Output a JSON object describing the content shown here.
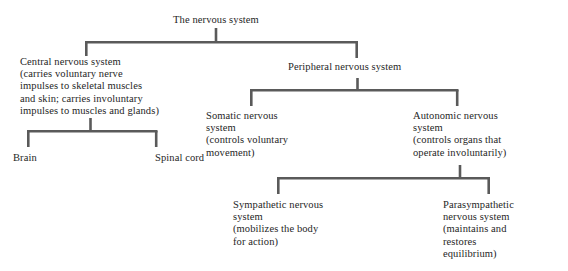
{
  "diagram": {
    "title": "The nervous system",
    "type": "hierarchy-tree",
    "line_color": "#5a5a5a",
    "text_color": "#262626",
    "background": "#ffffff",
    "nodes": [
      {
        "id": "root",
        "label": "The nervous system"
      },
      {
        "id": "cns",
        "label": "Central nervous system\n(carries voluntary nerve\nimpulses to skeletal muscles\nand skin; carries involuntary\nimpulses to muscles and glands)"
      },
      {
        "id": "pns",
        "label": "Peripheral nervous system"
      },
      {
        "id": "brain",
        "label": "Brain"
      },
      {
        "id": "spinal-cord",
        "label": "Spinal cord"
      },
      {
        "id": "somatic",
        "label": "Somatic nervous\nsystem\n(controls voluntary\nmovement)"
      },
      {
        "id": "autonomic",
        "label": "Autonomic nervous\nsystem\n(controls organs that\noperate involuntarily)"
      },
      {
        "id": "sympathetic",
        "label": "Sympathetic nervous\nsystem\n(mobilizes the body\nfor action)"
      },
      {
        "id": "parasympathetic",
        "label": "Parasympathetic\nnervous system\n(maintains and\nrestores\nequilibrium)"
      }
    ]
  }
}
